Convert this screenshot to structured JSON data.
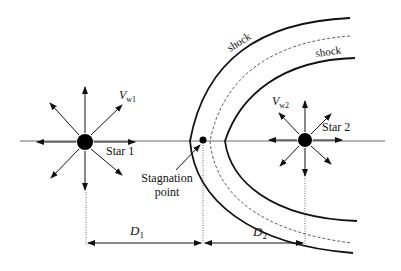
{
  "diagram": {
    "stars": [
      {
        "label": "Star 1",
        "wind_symbol": "V",
        "wind_sub": "w1"
      },
      {
        "label": "Star 2",
        "wind_symbol": "V",
        "wind_sub": "w2"
      }
    ],
    "shock_outer_label": "shock",
    "shock_inner_label": "shock",
    "stagnation_label_line1": "Stagnation",
    "stagnation_label_line2": "point",
    "distances": [
      {
        "symbol": "D",
        "sub": "1"
      },
      {
        "symbol": "D",
        "sub": "2"
      }
    ]
  }
}
